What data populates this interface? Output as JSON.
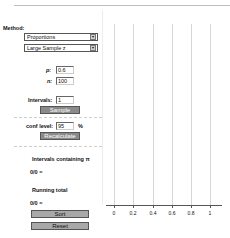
{
  "panel": {
    "method_label": "Method:",
    "method_select": "Proportions",
    "method_sub_select": "Large Sample z",
    "p_label": "p:",
    "p_value": "0.6",
    "n_label": "n:",
    "n_value": "100",
    "intervals_label": "Intervals:",
    "intervals_value": "1",
    "sample_button": "Sample",
    "conf_level_label": "conf level:",
    "conf_level_value": "95",
    "percent_sign": "%",
    "recalculate_button": "Recalculate",
    "containing_label": "Intervals containing π",
    "containing_value": "0/0 =",
    "running_total_label": "Running total",
    "running_total_value": "0/0 =",
    "sort_button": "Sort",
    "reset_button": "Reset",
    "select_arrow": "▾"
  },
  "chart": {
    "ticks": [
      "0",
      "0.2",
      "0.4",
      "0.6",
      "0.8",
      "1"
    ],
    "grid_color": "#d6d6d6",
    "axis_color": "#555555"
  }
}
